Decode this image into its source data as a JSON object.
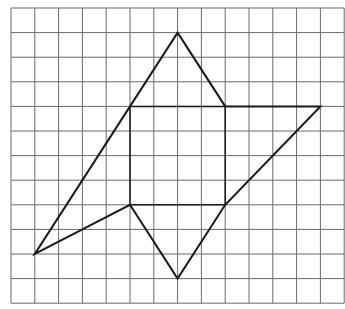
{
  "grid": {
    "origin_px": [
      11,
      8
    ],
    "cell_w": 23.8,
    "cell_h": 24.6,
    "cols": 14,
    "rows": 12,
    "line_color": "#6a6a6a",
    "line_width": 1
  },
  "figure": {
    "stroke_color": "#1a1a1a",
    "stroke_width": 2,
    "outer_polygon": [
      [
        7,
        1
      ],
      [
        9,
        4
      ],
      [
        13,
        4
      ],
      [
        9,
        8
      ],
      [
        7,
        11
      ],
      [
        5,
        8
      ],
      [
        1,
        10
      ],
      [
        5,
        4
      ]
    ],
    "inner_segments": [
      [
        [
          5,
          4
        ],
        [
          9,
          4
        ]
      ],
      [
        [
          5,
          4
        ],
        [
          5,
          8
        ]
      ],
      [
        [
          9,
          4
        ],
        [
          9,
          8
        ]
      ],
      [
        [
          5,
          8
        ],
        [
          9,
          8
        ]
      ]
    ]
  }
}
